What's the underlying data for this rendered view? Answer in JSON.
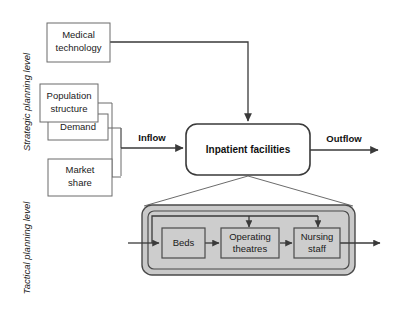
{
  "figure": {
    "background_color": "#ffffff",
    "panel_fill_color": "#c9c9c9",
    "line_color": "#3a3a3a"
  },
  "levels": {
    "strategic_label": "Strategic planning level",
    "tactical_label": "Tactical planning level"
  },
  "strategic": {
    "inputs": [
      {
        "id": "medical-technology",
        "label_line1": "Medical",
        "label_line2": "technology"
      },
      {
        "id": "population-structure",
        "label_line1": "Population",
        "label_line2": "structure"
      },
      {
        "id": "demand",
        "label_line1": "Demand",
        "label_line2": ""
      },
      {
        "id": "market-share",
        "label_line1": "Market",
        "label_line2": "share"
      }
    ],
    "hub": {
      "id": "inpatient-facilities",
      "label": "Inpatient facilities"
    },
    "flows": {
      "inflow_label": "Inflow",
      "outflow_label": "Outflow"
    }
  },
  "tactical": {
    "resources": [
      {
        "id": "beds",
        "label_line1": "Beds",
        "label_line2": ""
      },
      {
        "id": "operating-theatres",
        "label_line1": "Operating",
        "label_line2": "theatres"
      },
      {
        "id": "nursing-staff",
        "label_line1": "Nursing",
        "label_line2": "staff"
      }
    ]
  }
}
